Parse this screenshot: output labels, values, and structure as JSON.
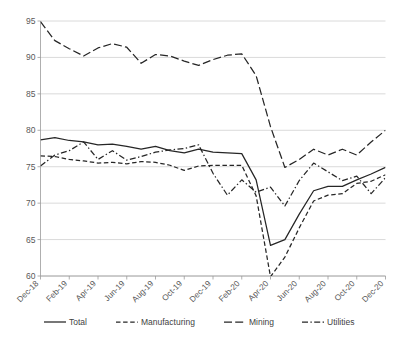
{
  "chart_data": {
    "type": "line",
    "title": "",
    "subtitle": "",
    "xlabel": "",
    "ylabel": "",
    "ylim": [
      60,
      95
    ],
    "ytick_labels": [
      "60",
      "65",
      "70",
      "75",
      "80",
      "85",
      "90",
      "95"
    ],
    "ytick_values": [
      60,
      65,
      70,
      75,
      80,
      85,
      90,
      95
    ],
    "grid": true,
    "legend_position": "bottom",
    "x": [
      "Dec-18",
      "Jan-19",
      "Feb-19",
      "Mar-19",
      "Apr-19",
      "May-19",
      "Jun-19",
      "Jul-19",
      "Aug-19",
      "Sep-19",
      "Oct-19",
      "Nov-19",
      "Dec-19",
      "Jan-20",
      "Feb-20",
      "Mar-20",
      "Apr-20",
      "May-20",
      "Jun-20",
      "Jul-20",
      "Aug-20",
      "Sep-20",
      "Oct-20",
      "Nov-20",
      "Dec-20"
    ],
    "xtick_labels": [
      "Dec-18",
      "Feb-19",
      "Apr-19",
      "Jun-19",
      "Aug-19",
      "Oct-19",
      "Dec-19",
      "Feb-20",
      "Apr-20",
      "Jun-20",
      "Aug-20",
      "Oct-20",
      "Dec-20"
    ],
    "series": [
      {
        "name": "Total",
        "style": "solid",
        "color": "#262626",
        "values": [
          78.7,
          79.0,
          78.6,
          78.4,
          78.0,
          78.1,
          77.8,
          77.4,
          77.8,
          77.2,
          76.9,
          77.4,
          77.0,
          76.9,
          76.8,
          73.2,
          64.2,
          65.0,
          68.5,
          71.7,
          72.3,
          72.3,
          73.2,
          74.0,
          74.9
        ]
      },
      {
        "name": "Manufacturing",
        "style": "dashed",
        "color": "#262626",
        "values": [
          76.5,
          76.4,
          76.0,
          75.8,
          75.5,
          75.6,
          75.4,
          75.7,
          75.6,
          75.2,
          74.5,
          75.1,
          75.2,
          75.2,
          75.2,
          71.0,
          59.9,
          62.6,
          66.6,
          70.3,
          71.1,
          71.3,
          72.7,
          73.0,
          73.9
        ]
      },
      {
        "name": "Mining",
        "style": "longdash",
        "color": "#262626",
        "values": [
          94.9,
          92.3,
          91.2,
          90.2,
          91.3,
          91.9,
          91.4,
          89.2,
          90.4,
          90.2,
          89.5,
          88.9,
          89.7,
          90.3,
          90.5,
          87.5,
          80.5,
          74.9,
          76.0,
          77.4,
          76.6,
          77.4,
          76.6,
          78.4,
          80.0
        ]
      },
      {
        "name": "Utilities",
        "style": "dashdot",
        "color": "#262626",
        "values": [
          75.1,
          76.6,
          77.2,
          78.4,
          76.0,
          77.2,
          75.9,
          76.4,
          77.0,
          77.3,
          77.5,
          78.0,
          74.1,
          71.1,
          73.2,
          71.5,
          72.2,
          69.6,
          73.1,
          75.5,
          74.3,
          73.1,
          73.7,
          71.3,
          73.5
        ]
      }
    ]
  },
  "legend": {
    "items": [
      {
        "label": "Total",
        "style": "solid"
      },
      {
        "label": "Manufacturing",
        "style": "dashed"
      },
      {
        "label": "Mining",
        "style": "longdash"
      },
      {
        "label": "Utilities",
        "style": "dashdot"
      }
    ]
  }
}
